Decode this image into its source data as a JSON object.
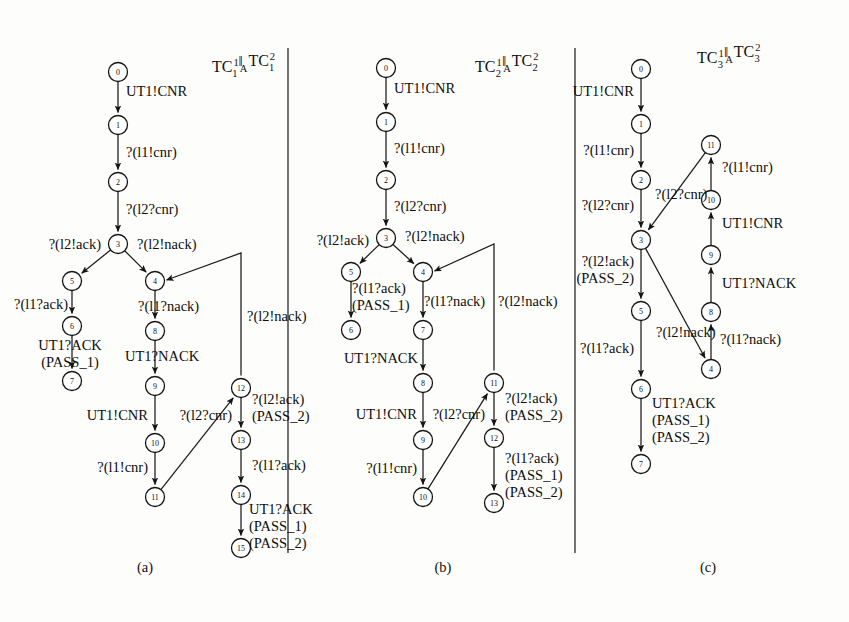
{
  "figure": {
    "background_color": "#fdfdfb",
    "ink_color": "#111111",
    "panel_separators_x": [
      288,
      575
    ]
  },
  "panels": [
    {
      "id": "a",
      "caption": "(a)",
      "caption_pos": {
        "x": 145,
        "y": 572
      },
      "title": {
        "prefix": "TC",
        "sup1": "1",
        "sub1": "1",
        "parallel": "‖",
        "sub_mid": "A",
        "prefix2": "TC",
        "sup2": "2",
        "sub2": "1",
        "plain": "TC1^1 ||A TC1^2",
        "pos": {
          "x": 212,
          "y": 72
        }
      },
      "nodes": [
        {
          "id": "0",
          "x": 118,
          "y": 72
        },
        {
          "id": "1",
          "x": 118,
          "y": 125
        },
        {
          "id": "2",
          "x": 118,
          "y": 182
        },
        {
          "id": "3",
          "x": 118,
          "y": 244
        },
        {
          "id": "5",
          "x": 72,
          "y": 281
        },
        {
          "id": "4",
          "x": 155,
          "y": 281
        },
        {
          "id": "6",
          "x": 72,
          "y": 326
        },
        {
          "id": "8",
          "x": 155,
          "y": 331
        },
        {
          "id": "7",
          "x": 72,
          "y": 381
        },
        {
          "id": "9",
          "x": 155,
          "y": 386
        },
        {
          "id": "12",
          "x": 241,
          "y": 388
        },
        {
          "id": "10",
          "x": 155,
          "y": 443
        },
        {
          "id": "13",
          "x": 241,
          "y": 440
        },
        {
          "id": "11",
          "x": 155,
          "y": 497
        },
        {
          "id": "14",
          "x": 241,
          "y": 495
        },
        {
          "id": "15",
          "x": 241,
          "y": 548
        }
      ],
      "edges": [
        {
          "from": "0",
          "to": "1",
          "label": "UT1!CNR",
          "label_x": 126,
          "label_y": 96,
          "anchor": "start"
        },
        {
          "from": "1",
          "to": "2",
          "label": "?(l1!cnr)",
          "label_x": 126,
          "label_y": 157,
          "anchor": "start"
        },
        {
          "from": "2",
          "to": "3",
          "label": "?(l2?cnr)",
          "label_x": 126,
          "label_y": 214,
          "anchor": "start"
        },
        {
          "from": "3",
          "to": "5",
          "label": "?(l2!ack)",
          "label_x": 101,
          "label_y": 249,
          "anchor": "end"
        },
        {
          "from": "3",
          "to": "4",
          "label": "?(l2!nack)",
          "label_x": 137,
          "label_y": 249,
          "anchor": "start"
        },
        {
          "from": "5",
          "to": "6",
          "label": "?(l1?ack)",
          "label_x": 68,
          "label_y": 309,
          "anchor": "end"
        },
        {
          "from": "4",
          "to": "8",
          "label": "?(l1?nack)",
          "label_x": 138,
          "label_y": 311,
          "anchor": "start"
        },
        {
          "from": "6",
          "to": "7",
          "label": "UT1?ACK\n(PASS_1)",
          "label_x": 70,
          "label_y": 350,
          "anchor": "mid"
        },
        {
          "from": "8",
          "to": "9",
          "label": "UT1?NACK",
          "label_x": 125,
          "label_y": 361,
          "anchor": "start"
        },
        {
          "from": "9",
          "to": "10",
          "label": "UT1!CNR",
          "label_x": 148,
          "label_y": 420,
          "anchor": "end"
        },
        {
          "from": "10",
          "to": "11",
          "label": "?(l1!cnr)",
          "label_x": 148,
          "label_y": 472,
          "anchor": "end"
        },
        {
          "from": "11",
          "to": "12",
          "label": "?(l2?cnr)",
          "label_x": 232,
          "label_y": 420,
          "anchor": "end"
        },
        {
          "from": "4",
          "to": "12",
          "label": "?(l2!nack)",
          "label_x": 247,
          "label_y": 321,
          "anchor": "start",
          "routed": true
        },
        {
          "from": "12",
          "to": "13",
          "label": "?(l2!ack)\n(PASS_2)",
          "label_x": 252,
          "label_y": 404,
          "anchor": "start"
        },
        {
          "from": "13",
          "to": "14",
          "label": "?(l1?ack)",
          "label_x": 252,
          "label_y": 470,
          "anchor": "start"
        },
        {
          "from": "14",
          "to": "15",
          "label": "UT1?ACK\n(PASS_1)\n(PASS_2)",
          "label_x": 249,
          "label_y": 514,
          "anchor": "start"
        }
      ]
    },
    {
      "id": "b",
      "caption": "(b)",
      "caption_pos": {
        "x": 443,
        "y": 572
      },
      "title": {
        "prefix": "TC",
        "sup1": "1",
        "sub1": "2",
        "parallel": "‖",
        "sub_mid": "A",
        "prefix2": "TC",
        "sup2": "2",
        "sub2": "2",
        "plain": "TC2^1 ||A TC2^2",
        "pos": {
          "x": 475,
          "y": 72
        }
      },
      "nodes": [
        {
          "id": "0",
          "x": 386,
          "y": 68
        },
        {
          "id": "1",
          "x": 386,
          "y": 122
        },
        {
          "id": "2",
          "x": 386,
          "y": 180
        },
        {
          "id": "3",
          "x": 386,
          "y": 238
        },
        {
          "id": "5",
          "x": 351,
          "y": 272
        },
        {
          "id": "4",
          "x": 423,
          "y": 272
        },
        {
          "id": "6",
          "x": 351,
          "y": 330
        },
        {
          "id": "7",
          "x": 423,
          "y": 330
        },
        {
          "id": "8",
          "x": 423,
          "y": 383
        },
        {
          "id": "11",
          "x": 494,
          "y": 383
        },
        {
          "id": "9",
          "x": 423,
          "y": 440
        },
        {
          "id": "12",
          "x": 494,
          "y": 438
        },
        {
          "id": "10",
          "x": 423,
          "y": 497
        },
        {
          "id": "13",
          "x": 494,
          "y": 503
        }
      ],
      "edges": [
        {
          "from": "0",
          "to": "1",
          "label": "UT1!CNR",
          "label_x": 394,
          "label_y": 93,
          "anchor": "start"
        },
        {
          "from": "1",
          "to": "2",
          "label": "?(l1!cnr)",
          "label_x": 394,
          "label_y": 153,
          "anchor": "start"
        },
        {
          "from": "2",
          "to": "3",
          "label": "?(l2?cnr)",
          "label_x": 394,
          "label_y": 211,
          "anchor": "start"
        },
        {
          "from": "3",
          "to": "5",
          "label": "?(l2!ack)",
          "label_x": 369,
          "label_y": 245,
          "anchor": "end"
        },
        {
          "from": "3",
          "to": "4",
          "label": "?(l2!nack)",
          "label_x": 405,
          "label_y": 241,
          "anchor": "start"
        },
        {
          "from": "5",
          "to": "6",
          "label": "?(l1?ack)\n(PASS_1)",
          "label_x": 352,
          "label_y": 293,
          "anchor": "start"
        },
        {
          "from": "4",
          "to": "7",
          "label": "?(l1?nack)",
          "label_x": 424,
          "label_y": 306,
          "anchor": "start"
        },
        {
          "from": "7",
          "to": "8",
          "label": "UT1?NACK",
          "label_x": 418,
          "label_y": 363,
          "anchor": "end"
        },
        {
          "from": "8",
          "to": "9",
          "label": "UT1!CNR",
          "label_x": 417,
          "label_y": 419,
          "anchor": "end"
        },
        {
          "from": "9",
          "to": "10",
          "label": "?(l1!cnr)",
          "label_x": 417,
          "label_y": 473,
          "anchor": "end"
        },
        {
          "from": "10",
          "to": "11",
          "label": "?(l2?cnr)",
          "label_x": 485,
          "label_y": 419,
          "anchor": "end"
        },
        {
          "from": "4",
          "to": "11",
          "label": "?(l2!nack)",
          "label_x": 498,
          "label_y": 306,
          "anchor": "start",
          "routed": true
        },
        {
          "from": "11",
          "to": "12",
          "label": "?(l2!ack)\n(PASS_2)",
          "label_x": 505,
          "label_y": 403,
          "anchor": "start"
        },
        {
          "from": "12",
          "to": "13",
          "label": "?(l1?ack)\n(PASS_1)\n(PASS_2)",
          "label_x": 505,
          "label_y": 463,
          "anchor": "start"
        }
      ]
    },
    {
      "id": "c",
      "caption": "(c)",
      "caption_pos": {
        "x": 708,
        "y": 572
      },
      "title": {
        "prefix": "TC",
        "sup1": "1",
        "sub1": "3",
        "parallel": "‖",
        "sub_mid": "A",
        "prefix2": "TC",
        "sup2": "2",
        "sub2": "3",
        "plain": "TC3^1 ||A TC3^2",
        "pos": {
          "x": 697,
          "y": 63
        }
      },
      "nodes": [
        {
          "id": "0",
          "x": 641,
          "y": 69
        },
        {
          "id": "1",
          "x": 641,
          "y": 124
        },
        {
          "id": "11",
          "x": 711,
          "y": 145
        },
        {
          "id": "2",
          "x": 641,
          "y": 180
        },
        {
          "id": "10",
          "x": 711,
          "y": 200
        },
        {
          "id": "3",
          "x": 641,
          "y": 240
        },
        {
          "id": "9",
          "x": 711,
          "y": 255
        },
        {
          "id": "5",
          "x": 641,
          "y": 311
        },
        {
          "id": "8",
          "x": 711,
          "y": 312
        },
        {
          "id": "4",
          "x": 711,
          "y": 369
        },
        {
          "id": "6",
          "x": 641,
          "y": 389
        },
        {
          "id": "7",
          "x": 641,
          "y": 464
        }
      ],
      "edges": [
        {
          "from": "0",
          "to": "1",
          "label": "UT1!CNR",
          "label_x": 634,
          "label_y": 96,
          "anchor": "end"
        },
        {
          "from": "1",
          "to": "2",
          "label": "?(l1!cnr)",
          "label_x": 634,
          "label_y": 155,
          "anchor": "end"
        },
        {
          "from": "2",
          "to": "3",
          "label": "?(l2?cnr)",
          "label_x": 634,
          "label_y": 210,
          "anchor": "end"
        },
        {
          "from": "11",
          "to": "3",
          "label": "?(l2?cnr)",
          "label_x": 655,
          "label_y": 199,
          "anchor": "start"
        },
        {
          "from": "10",
          "to": "11",
          "label": "?(l1!cnr)",
          "label_x": 722,
          "label_y": 172,
          "anchor": "start"
        },
        {
          "from": "9",
          "to": "10",
          "label": "UT1!CNR",
          "label_x": 722,
          "label_y": 228,
          "anchor": "start"
        },
        {
          "from": "8",
          "to": "9",
          "label": "UT1?NACK",
          "label_x": 722,
          "label_y": 288,
          "anchor": "start"
        },
        {
          "from": "3",
          "to": "5",
          "label": "?(l2!ack)\n(PASS_2)",
          "label_x": 634,
          "label_y": 266,
          "anchor": "end"
        },
        {
          "from": "3",
          "to": "4",
          "label": "?(l2!nack)",
          "label_x": 656,
          "label_y": 337,
          "anchor": "start"
        },
        {
          "from": "4",
          "to": "8",
          "label": "?(l1?nack)",
          "label_x": 720,
          "label_y": 344,
          "anchor": "start"
        },
        {
          "from": "5",
          "to": "6",
          "label": "?(l1?ack)",
          "label_x": 634,
          "label_y": 353,
          "anchor": "end"
        },
        {
          "from": "6",
          "to": "7",
          "label": "UT1?ACK\n(PASS_1)\n(PASS_2)",
          "label_x": 652,
          "label_y": 408,
          "anchor": "start"
        }
      ]
    }
  ]
}
